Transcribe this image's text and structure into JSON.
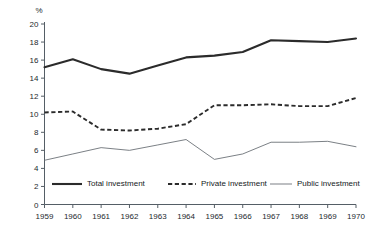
{
  "chart_data": {
    "type": "line",
    "title": "",
    "subtitle": "",
    "xlabel": "",
    "ylabel": "%",
    "unit_label": "%",
    "categories": [
      "1959",
      "1960",
      "1961",
      "1962",
      "1963",
      "1964",
      "1965",
      "1966",
      "1967",
      "1968",
      "1969",
      "1970"
    ],
    "x": [
      1959,
      1960,
      1961,
      1962,
      1963,
      1964,
      1965,
      1966,
      1967,
      1968,
      1969,
      1970
    ],
    "ylim": [
      0,
      20
    ],
    "xlim": [
      1959,
      1970
    ],
    "ytick_labels": [
      "0",
      "2",
      "4",
      "6",
      "8",
      "10",
      "12",
      "14",
      "16",
      "18",
      "20"
    ],
    "ytick_values": [
      0,
      2,
      4,
      6,
      8,
      10,
      12,
      14,
      16,
      18,
      20
    ],
    "xtick_labels": [
      "1959",
      "1960",
      "1961",
      "1962",
      "1963",
      "1964",
      "1965",
      "1966",
      "1967",
      "1968",
      "1969",
      "1970"
    ],
    "grid": false,
    "legend_position": "inside-bottom",
    "series": [
      {
        "name": "Total investment",
        "style": "solid-thick",
        "color": "#2b2b2b",
        "values": [
          15.2,
          16.1,
          15.0,
          14.5,
          15.4,
          16.3,
          16.5,
          16.9,
          18.2,
          18.1,
          18.0,
          18.4
        ]
      },
      {
        "name": "Private investment",
        "style": "dashed",
        "color": "#2b2b2b",
        "values": [
          10.2,
          10.3,
          8.3,
          8.2,
          8.4,
          8.9,
          11.0,
          11.0,
          11.1,
          10.9,
          10.9,
          11.8
        ]
      },
      {
        "name": "Public investment",
        "style": "solid-thin",
        "color": "#63696f",
        "values": [
          4.9,
          5.6,
          6.3,
          6.0,
          6.6,
          7.2,
          5.0,
          5.6,
          6.9,
          6.9,
          7.0,
          6.4
        ]
      }
    ],
    "legend": [
      {
        "label": "Total investment",
        "style": "solid-thick",
        "color": "#2b2b2b"
      },
      {
        "label": "Private investment",
        "style": "dashed",
        "color": "#2b2b2b"
      },
      {
        "label": "Public investment",
        "style": "solid-thin",
        "color": "#63696f"
      }
    ],
    "annotations": []
  },
  "colors": {
    "background": "#ffffff",
    "axis": "#555e66",
    "text": "#23292e",
    "total": "#2b2b2b",
    "private": "#2b2b2b",
    "public": "#63696f"
  }
}
